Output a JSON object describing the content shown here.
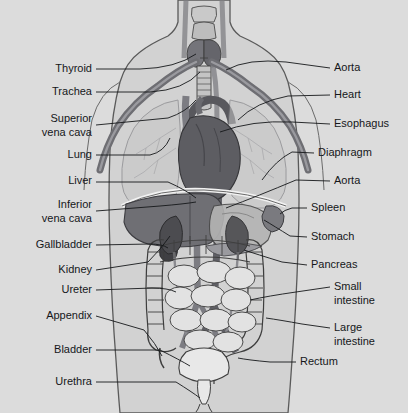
{
  "image": {
    "title": "Human torso internal organs anatomical diagram",
    "width": 408,
    "height": 413,
    "background_color": "#dcdcdc"
  },
  "palette": {
    "background": "#dcdcdc",
    "body_fill": "#d2d2d2",
    "body_outline": "#4a4a4a",
    "vessel_dark": "#6e6e73",
    "vessel_mid": "#8a8a8f",
    "heart": "#5d5d62",
    "liver": "#6f6f74",
    "lung": "#c6c6c6",
    "stomach": "#b4b4b4",
    "intestine": "#e2e2e2",
    "intestine_outline": "#3e3e3e",
    "kidney": "#4c4c50",
    "spleen": "#7a7a7f",
    "bladder": "#e8e8e8",
    "label_text": "#15171a",
    "leader_line": "#15171a"
  },
  "labels_left": [
    {
      "id": "thyroid",
      "text": "Thyroid",
      "lines": [
        "Thyroid"
      ],
      "x": 92,
      "y": 72
    },
    {
      "id": "trachea",
      "text": "Trachea",
      "lines": [
        "Trachea"
      ],
      "x": 92,
      "y": 95
    },
    {
      "id": "superior-vena-cava",
      "text": "Superior vena cava",
      "lines": [
        "Superior",
        "vena cava"
      ],
      "x": 92,
      "y": 122
    },
    {
      "id": "lung",
      "text": "Lung",
      "lines": [
        "Lung"
      ],
      "x": 92,
      "y": 158
    },
    {
      "id": "liver",
      "text": "Liver",
      "lines": [
        "Liver"
      ],
      "x": 92,
      "y": 184
    },
    {
      "id": "inferior-vena-cava",
      "text": "Inferior vena cava",
      "lines": [
        "Inferior",
        "vena cava"
      ],
      "x": 92,
      "y": 208
    },
    {
      "id": "gallbladder",
      "text": "Gallbladder",
      "lines": [
        "Gallbladder"
      ],
      "x": 92,
      "y": 248
    },
    {
      "id": "kidney",
      "text": "Kidney",
      "lines": [
        "Kidney"
      ],
      "x": 92,
      "y": 273
    },
    {
      "id": "ureter",
      "text": "Ureter",
      "lines": [
        "Ureter"
      ],
      "x": 92,
      "y": 293
    },
    {
      "id": "appendix",
      "text": "Appendix",
      "lines": [
        "Appendix"
      ],
      "x": 92,
      "y": 319
    },
    {
      "id": "bladder",
      "text": "Bladder",
      "lines": [
        "Bladder"
      ],
      "x": 92,
      "y": 353
    },
    {
      "id": "urethra",
      "text": "Urethra",
      "lines": [
        "Urethra"
      ],
      "x": 92,
      "y": 385
    }
  ],
  "labels_right": [
    {
      "id": "aorta-arch",
      "text": "Aorta",
      "lines": [
        "Aorta"
      ],
      "x": 334,
      "y": 71
    },
    {
      "id": "heart",
      "text": "Heart",
      "lines": [
        "Heart"
      ],
      "x": 334,
      "y": 98
    },
    {
      "id": "esophagus",
      "text": "Esophagus",
      "lines": [
        "Esophagus"
      ],
      "x": 334,
      "y": 127
    },
    {
      "id": "diaphragm",
      "text": "Diaphragm",
      "lines": [
        "Diaphragm"
      ],
      "x": 318,
      "y": 156
    },
    {
      "id": "aorta-abdominal",
      "text": "Aorta",
      "lines": [
        "Aorta"
      ],
      "x": 334,
      "y": 184
    },
    {
      "id": "spleen",
      "text": "Spleen",
      "lines": [
        "Spleen"
      ],
      "x": 311,
      "y": 211
    },
    {
      "id": "stomach",
      "text": "Stomach",
      "lines": [
        "Stomach"
      ],
      "x": 311,
      "y": 240
    },
    {
      "id": "pancreas",
      "text": "Pancreas",
      "lines": [
        "Pancreas"
      ],
      "x": 311,
      "y": 268
    },
    {
      "id": "small-intestine",
      "text": "Small intestine",
      "lines": [
        "Small",
        "intestine"
      ],
      "x": 334,
      "y": 290
    },
    {
      "id": "large-intestine",
      "text": "Large intestine",
      "lines": [
        "Large",
        "intestine"
      ],
      "x": 334,
      "y": 331
    },
    {
      "id": "rectum",
      "text": "Rectum",
      "lines": [
        "Rectum"
      ],
      "x": 300,
      "y": 365
    }
  ]
}
